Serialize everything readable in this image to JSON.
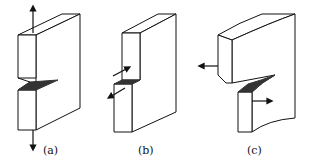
{
  "figure": {
    "panels": [
      {
        "id": "a",
        "label": "(a)",
        "mode": "opening (tensile)",
        "arrows": [
          "up",
          "down"
        ]
      },
      {
        "id": "b",
        "label": "(b)",
        "mode": "in-plane shear (sliding)",
        "arrows": [
          "up-right",
          "down-left"
        ]
      },
      {
        "id": "c",
        "label": "(c)",
        "mode": "out-of-plane shear (tearing)",
        "arrows": [
          "left",
          "right"
        ]
      }
    ],
    "colors": {
      "stroke": "#111111",
      "crack": "#333333",
      "background": "#ffffff"
    }
  }
}
